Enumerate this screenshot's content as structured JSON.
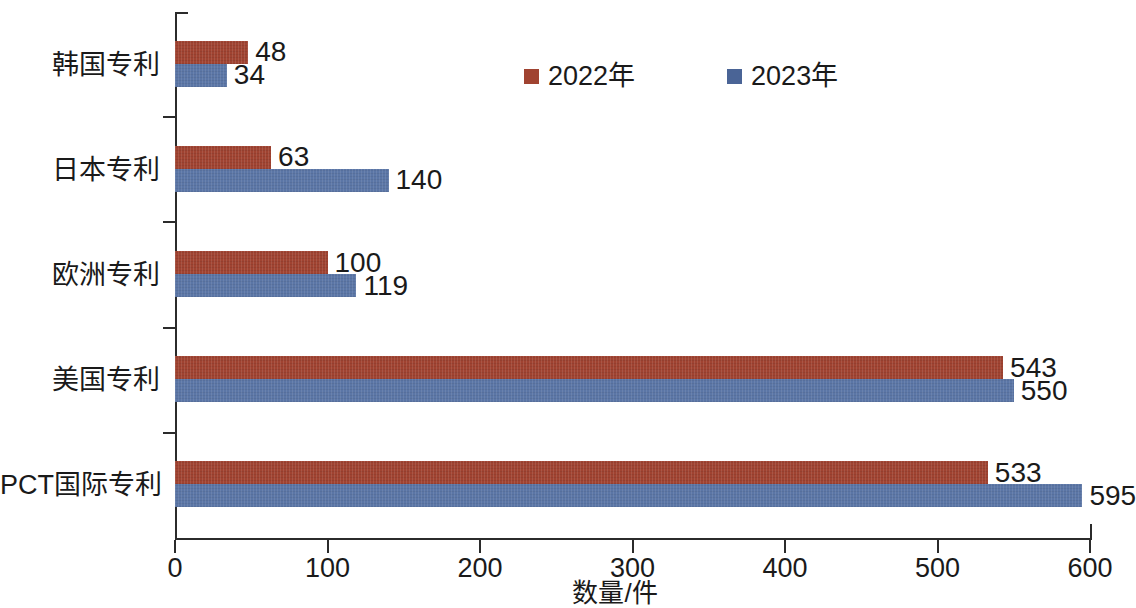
{
  "chart_data": {
    "type": "bar",
    "orientation": "horizontal",
    "title": "",
    "xlabel": "数量/件",
    "ylabel": "",
    "xlim": [
      0,
      600
    ],
    "xticks": [
      0,
      100,
      200,
      300,
      400,
      500,
      600
    ],
    "xtick_labels": [
      "0",
      "100",
      "200",
      "300",
      "400",
      "500",
      "600"
    ],
    "grid": false,
    "legend_position": "top-center",
    "categories": [
      "韩国专利",
      "日本专利",
      "欧洲专利",
      "美国专利",
      "PCT国际专利"
    ],
    "series": [
      {
        "name": "2022年",
        "color": "#a04331",
        "values": [
          48,
          63,
          100,
          543,
          533
        ],
        "value_labels": [
          "48",
          "63",
          "100",
          "543",
          "533"
        ]
      },
      {
        "name": "2023年",
        "color": "#5b76a6",
        "values": [
          34,
          140,
          119,
          550,
          595
        ],
        "value_labels": [
          "34",
          "140",
          "119",
          "550",
          "595"
        ]
      }
    ]
  },
  "legend": {
    "items": [
      {
        "label": "2022年",
        "color": "#a04331"
      },
      {
        "label": "2023年",
        "color": "#4a6496"
      }
    ]
  },
  "axis": {
    "x_title": "数量/件",
    "x_tick_labels": [
      "0",
      "100",
      "200",
      "300",
      "400",
      "500",
      "600"
    ],
    "y_category_labels": [
      "韩国专利",
      "日本专利",
      "欧洲专利",
      "美国专利",
      "PCT国际专利"
    ]
  },
  "colors": {
    "series_2022": "#a04331",
    "series_2023": "#5b76a6",
    "axis": "#2b2b2b",
    "text": "#1a1a1a",
    "background": "#ffffff"
  }
}
